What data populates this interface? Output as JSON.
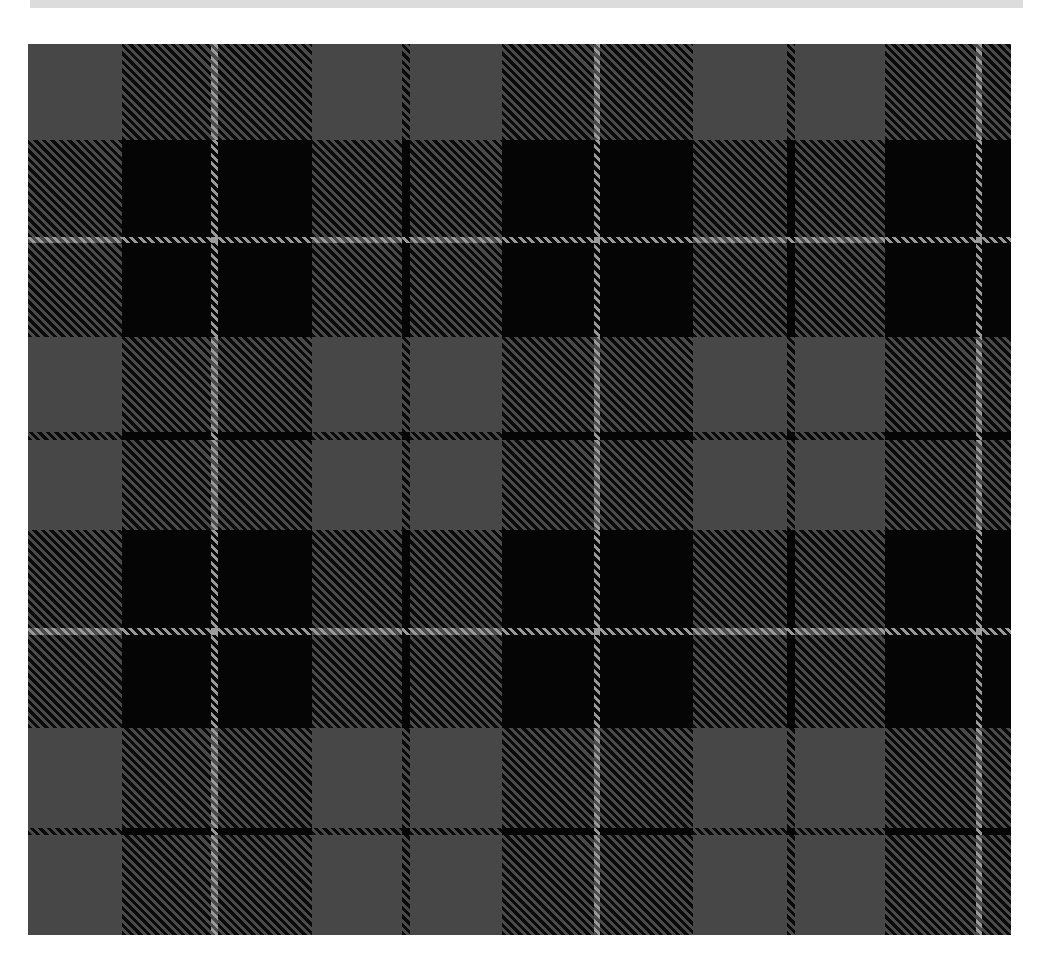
{
  "image": {
    "description": "Grey and black tartan plaid fabric pattern with thin light-grey overcheck lines",
    "colors": {
      "grey": "#474747",
      "black": "#050505",
      "overcheck": "#9c9c9c",
      "top_strip": "#dcdcdc",
      "background": "#ffffff"
    },
    "sett": {
      "columns": [
        {
          "c": "g",
          "w": 94
        },
        {
          "c": "b",
          "w": 89
        },
        {
          "c": "w",
          "w": 7
        },
        {
          "c": "b",
          "w": 94
        },
        {
          "c": "g",
          "w": 90
        },
        {
          "c": "b",
          "w": 8
        },
        {
          "c": "g",
          "w": 92
        },
        {
          "c": "b",
          "w": 92
        },
        {
          "c": "w",
          "w": 6
        },
        {
          "c": "b",
          "w": 93
        },
        {
          "c": "g",
          "w": 94
        },
        {
          "c": "b",
          "w": 8
        },
        {
          "c": "g",
          "w": 90
        },
        {
          "c": "b",
          "w": 91
        },
        {
          "c": "w",
          "w": 6
        },
        {
          "c": "b",
          "w": 29
        }
      ],
      "rows": [
        {
          "c": "g",
          "h": 96
        },
        {
          "c": "b",
          "h": 97
        },
        {
          "c": "w",
          "h": 6
        },
        {
          "c": "b",
          "h": 94
        },
        {
          "c": "g",
          "h": 95
        },
        {
          "c": "b",
          "h": 8
        },
        {
          "c": "g",
          "h": 90
        },
        {
          "c": "b",
          "h": 98
        },
        {
          "c": "w",
          "h": 7
        },
        {
          "c": "b",
          "h": 93
        },
        {
          "c": "g",
          "h": 100
        },
        {
          "c": "b",
          "h": 7
        },
        {
          "c": "g",
          "h": 100
        }
      ]
    }
  }
}
